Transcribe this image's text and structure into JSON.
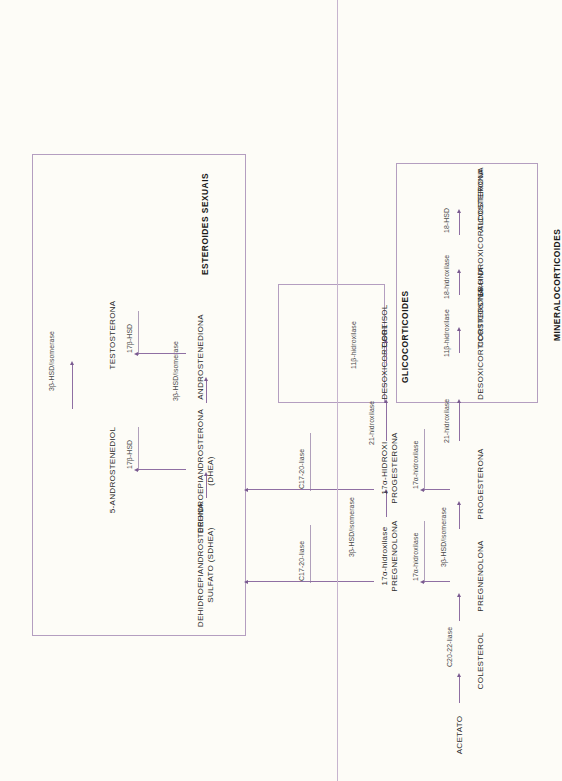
{
  "diagram": {
    "colors": {
      "background": "#fdfcf7",
      "arrow": "#8f6fa3",
      "box_border": "#b49ec0",
      "node_text": "#2b2b2b",
      "enzyme_text": "#4a4a4a"
    }
  },
  "groups": {
    "sex_steroids": "ESTEROIDES SEXUAIS",
    "glucocorticoids": "GLICOCORTICOIDES",
    "mineralocorticoids": "MINERALOCORTICOIDES"
  },
  "nodes": {
    "acetato": "ACETATO",
    "colesterol": "COLESTEROL",
    "pregnenolona": "PREGNENOLONA",
    "progesterona": "PROGESTERONA",
    "hidroxipregnenolona_l1": "17α-hidroxilase",
    "hidroxipregnenolona": "PREGNENOLONA",
    "hidroxiprogesterona_l1": "17α-HIDROXI",
    "hidroxiprogesterona_l2": "PROGESTERONA",
    "dheas_l1": "DEHIDROEPIANDROSTERONA",
    "dheas_l2": "SULFATO (SDHEA)",
    "dhea_l1": "DEHIDROEPIANDROSTERONA",
    "dhea_l2": "(DHEA)",
    "androstenediona": "ANDROSTENEDIONA",
    "androstenediol": "5-ANDROSTENEDIOL",
    "testosterona": "TESTOSTERONA",
    "desoxicorticosterona": "DESOXICORTICOSTERONA",
    "corticosterona": "CORTICOSTERONA",
    "hidroxicorticosterona": "18-HIDROXICORTICOSTERONA",
    "aldosterona": "ALDOSTERONA",
    "desoxicortisol": "DESOXICORTISOL",
    "cortisol": "CORTISOL"
  },
  "enzymes": {
    "c20_22_liase": "C20-22-liase",
    "hidroxilase_17a_1": "17α-hidroxilase",
    "hidroxilase_17a_2": "17α-hidroxilase",
    "hsd3b_isomerase_1": "3β-HSD/isomerase",
    "hsd3b_isomerase_2": "3β-HSD/isomerase",
    "hsd3b_isomerase_3": "3β-HSD/isomerase",
    "hsd3b_isomerase_4": "3β-HSD/isomerase",
    "hidroxilase_21_1": "21-hidroxilase",
    "hidroxilase_21_2": "21-hidroxilase",
    "liase_c17_20_1": "C17-20-liase",
    "liase_c17_20_2": "C17-20-liase",
    "hidroxilase_11b_1": "11β-hidroxilase",
    "hidroxilase_11b_2": "11β-hidroxilase",
    "hidroxilase_18": "18-hidroxilase",
    "hsd_18": "18-HSD",
    "hsd_17b_1": "17β-HSD",
    "hsd_17b_2": "17β-HSD"
  }
}
